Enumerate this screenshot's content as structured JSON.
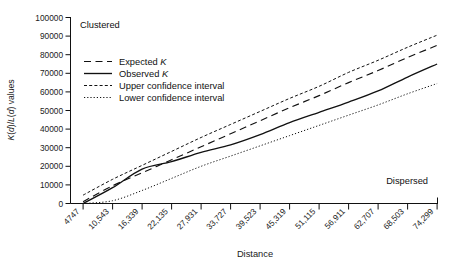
{
  "chart_data": {
    "type": "line",
    "title": "",
    "xlabel": "Distance",
    "ylabel": "K(d)/L(d) values",
    "grid": false,
    "legend_position": "upper-left-inside",
    "xlim": [
      4747,
      74299
    ],
    "ylim": [
      0,
      100000
    ],
    "ytick_labels": [
      "100000",
      "90000",
      "80000",
      "70000",
      "60000",
      "50000",
      "40000",
      "30000",
      "20000",
      "10000",
      "0"
    ],
    "ytick_values": [
      100000,
      90000,
      80000,
      70000,
      60000,
      50000,
      40000,
      30000,
      20000,
      10000,
      0
    ],
    "categories": [
      "4747",
      "10,543",
      "16,339",
      "22,135",
      "27,931",
      "33,727",
      "39,523",
      "45,319",
      "51,115",
      "56,911",
      "62,707",
      "68,503",
      "74,299"
    ],
    "x": [
      4747,
      10543,
      16339,
      22135,
      27931,
      33727,
      39523,
      45319,
      51115,
      56911,
      62707,
      68503,
      74299
    ],
    "series": [
      {
        "name": "Expected K",
        "style": "dashed",
        "values": [
          1000,
          9500,
          16500,
          23500,
          30500,
          37500,
          44500,
          51500,
          58000,
          65000,
          71500,
          78500,
          85000
        ]
      },
      {
        "name": "Observed K",
        "style": "solid",
        "values": [
          0,
          8500,
          18500,
          22500,
          27500,
          31500,
          37000,
          43500,
          49000,
          54500,
          60500,
          68000,
          75000
        ]
      },
      {
        "name": "Upper confidence interval",
        "style": "dashed-fine",
        "values": [
          4500,
          13000,
          20500,
          28000,
          35500,
          42500,
          49500,
          56500,
          63000,
          70500,
          77000,
          84000,
          90500
        ]
      },
      {
        "name": "Lower confidence interval",
        "style": "dotted",
        "values": [
          0,
          1500,
          7000,
          13500,
          20000,
          25500,
          31000,
          36500,
          42000,
          47500,
          53000,
          59000,
          64500
        ]
      }
    ],
    "annotations": [
      {
        "text": "Clustered",
        "position": "top-left"
      },
      {
        "text": "Dispersed",
        "position": "bottom-right"
      }
    ]
  },
  "legend": {
    "items": [
      {
        "label_main": "Expected ",
        "label_italic": "K"
      },
      {
        "label_main": "Observed ",
        "label_italic": "K"
      },
      {
        "label_main": "Upper confidence interval",
        "label_italic": ""
      },
      {
        "label_main": "Lower confidence interval",
        "label_italic": ""
      }
    ]
  },
  "labels": {
    "clustered": "Clustered",
    "dispersed": "Dispersed",
    "x_axis_title": "Distance",
    "y_axis_title_prefix": "K(",
    "y_axis_title": "K(d)/L(d) values"
  },
  "colors": {
    "ink": "#111111",
    "background": "#ffffff"
  }
}
